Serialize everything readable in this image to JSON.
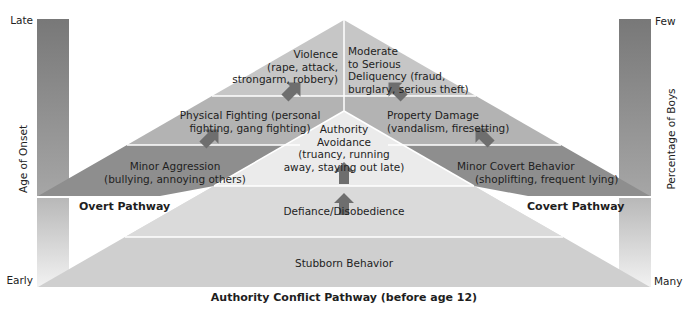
{
  "figure": {
    "footer_title": "Authority Conflict Pathway (before age 12)"
  },
  "left_axis": {
    "label": "Age of Onset",
    "top_label": "Late",
    "bottom_label": "Early"
  },
  "right_axis": {
    "label": "Percentage of Boys",
    "top_label": "Few",
    "bottom_label": "Many"
  },
  "pathways": {
    "overt": {
      "label": "Overt Pathway",
      "stages": [
        {
          "line1": "Minor Aggression",
          "line2": "(bullying, annoying others)"
        },
        {
          "line1": "Physical Fighting (personal",
          "line2": "fighting, gang fighting)"
        },
        {
          "line1": "Violence",
          "line2": "(rape, attack,",
          "line3": "strongarm, robbery)"
        }
      ]
    },
    "covert": {
      "label": "Covert Pathway",
      "stages": [
        {
          "line1": "Minor Covert Behavior",
          "line2": "(shoplifting, frequent lying)"
        },
        {
          "line1": "Property Damage",
          "line2": "(vandalism, firesetting)"
        },
        {
          "line1": "Moderate",
          "line2": "to Serious",
          "line3": "Deliquency (fraud,",
          "line4": "burglary, serious theft)"
        }
      ]
    },
    "authority_conflict": {
      "stages": [
        {
          "line1": "Stubborn Behavior"
        },
        {
          "line1": "Defiance/Disobedience"
        },
        {
          "line1": "Authority",
          "line2": "Avoidance",
          "line3": "(truancy, running",
          "line4": "away, staying out late)"
        }
      ]
    }
  },
  "colors": {
    "top_band": "#c7c7c7",
    "middle_band": "#b4b4b4",
    "lower_band": "#8f8f8f",
    "authority_top": "#ececec",
    "authority_mid": "#dcdcdc",
    "authority_base": "#d0d0d0",
    "arrow": "#6f6f6f",
    "bar_dark": "#7a7a7a",
    "bar_light": "#eeeeee"
  }
}
